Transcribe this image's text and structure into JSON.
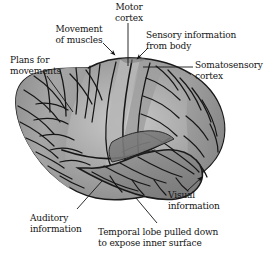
{
  "figure": {
    "background_color": "#ffffff",
    "ink_color": "#141414",
    "brain_fill": "#9a9a9a",
    "brain_fill_light": "#c4c4c4",
    "brain_fill_dark": "#7b7b7b",
    "brain_outline": "#1a1a1a"
  },
  "labels": {
    "motor_cortex": "Motor\ncortex",
    "movement_of_muscles": "Movement\nof muscles",
    "sensory_information_from_body": "Sensory information\nfrom body",
    "somatosensory_cortex": "Somatosensory\ncortex",
    "plans_for_movements": "Plans for\nmovements",
    "auditory_information": "Auditory\ninformation",
    "visual_information": "Visual\ninformation",
    "temporal_lobe_note": "Temporal lobe pulled down\nto expose inner surface"
  },
  "leaders": [
    {
      "name": "motor-cortex-leader",
      "type": "line",
      "from": [
        128,
        22
      ],
      "to": [
        128,
        66
      ]
    },
    {
      "name": "movement-of-muscles-leader",
      "type": "arrow",
      "from": [
        104,
        44
      ],
      "to": [
        116,
        56
      ]
    },
    {
      "name": "sensory-information-leader",
      "type": "arrow",
      "from": [
        147,
        49
      ],
      "to": [
        137,
        59
      ]
    },
    {
      "name": "somatosensory-cortex-leader",
      "type": "line",
      "from": [
        193,
        67
      ],
      "to": [
        142,
        67
      ]
    },
    {
      "name": "plans-for-movements-leader",
      "type": "line",
      "from": [
        48,
        76
      ],
      "to": [
        72,
        110
      ]
    },
    {
      "name": "auditory-information-leader",
      "type": "line",
      "from": [
        78,
        207
      ],
      "to": [
        101,
        182
      ]
    },
    {
      "name": "visual-information-leader",
      "type": "arrow",
      "from": [
        188,
        190
      ],
      "to": [
        201,
        178
      ]
    },
    {
      "name": "temporal-lobe-leader",
      "type": "line",
      "from": [
        155,
        222
      ],
      "to": [
        135,
        198
      ]
    }
  ]
}
